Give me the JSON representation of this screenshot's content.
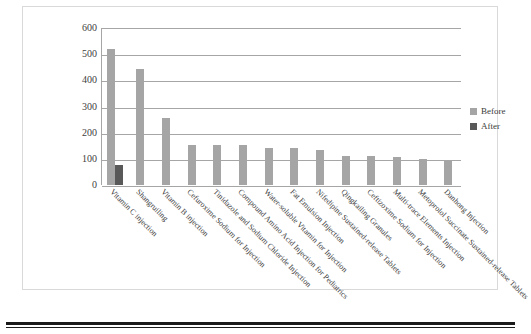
{
  "chart_data": {
    "type": "bar",
    "title": "",
    "xlabel": "",
    "ylabel": "",
    "ylim": [
      0,
      600
    ],
    "yticks": [
      600,
      500,
      400,
      300,
      200,
      100,
      0
    ],
    "grid": true,
    "legend_position": "right",
    "categories": [
      "Vitamin C injection",
      "Shangruiling",
      "Vitamin B injection",
      "Cefuroxime Sodium for Injection",
      "Tinidazole and Sodium Chloride Injection",
      "Compound Amino Acid Injection for Pediatrics",
      "Water-soluble Vitamin for Injection",
      "Fat Emulsion Injection",
      "Nifedipine Sustained-release Tablets",
      "Qingkailing Granules",
      "Ceftizoxime Sodium for Injection",
      "Multi-trace Elements Injection",
      "Metoprolol Succinate Sustained-release Tablets",
      "Danhong Injection"
    ],
    "series": [
      {
        "name": "Before",
        "color": "#a5a5a5",
        "values": [
          518,
          443,
          258,
          153,
          153,
          152,
          143,
          140,
          133,
          112,
          110,
          108,
          100,
          92
        ]
      },
      {
        "name": "After",
        "color": "#595959",
        "values": [
          75,
          0,
          0,
          0,
          0,
          0,
          0,
          0,
          0,
          0,
          0,
          0,
          0,
          0
        ]
      }
    ]
  },
  "legend": {
    "items": [
      {
        "label": "Before",
        "color": "#a5a5a5"
      },
      {
        "label": "After",
        "color": "#595959"
      }
    ]
  }
}
